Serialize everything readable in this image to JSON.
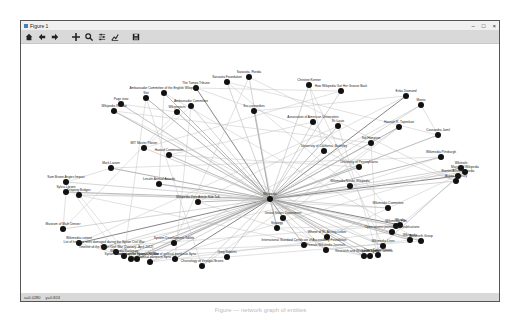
{
  "window": {
    "title": "Figure 1",
    "controls": {
      "minimize": "–",
      "maximize": "□",
      "close": "×"
    }
  },
  "toolbar": {
    "buttons": [
      {
        "name": "home-button",
        "icon": "home-icon",
        "tooltip": "Reset original view"
      },
      {
        "name": "back-button",
        "icon": "arrow-left-icon",
        "tooltip": "Back"
      },
      {
        "name": "forward-button",
        "icon": "arrow-right-icon",
        "tooltip": "Forward"
      },
      {
        "name": "pan-button",
        "icon": "move-icon",
        "tooltip": "Pan"
      },
      {
        "name": "zoom-button",
        "icon": "magnifier-icon",
        "tooltip": "Zoom to rectangle"
      },
      {
        "name": "subplots-button",
        "icon": "sliders-icon",
        "tooltip": "Configure subplots"
      },
      {
        "name": "axes-button",
        "icon": "chart-line-icon",
        "tooltip": "Edit axis"
      },
      {
        "name": "save-button",
        "icon": "floppy-disk-icon",
        "tooltip": "Save the figure"
      }
    ]
  },
  "status": {
    "x": "x=0.0280",
    "y": "y=0.824"
  },
  "caption": "Figure — network graph of entities",
  "graph": {
    "hub": {
      "x": 249,
      "y": 155,
      "label": "Wikipedia"
    },
    "nodes": [
      {
        "x": 175,
        "y": 44,
        "label": "The Tampa Tribune"
      },
      {
        "x": 206,
        "y": 38,
        "label": "Sarasota Foundation"
      },
      {
        "x": 228,
        "y": 33,
        "label": "Sarasota, Florida"
      },
      {
        "x": 143,
        "y": 49,
        "label": "Ambassador Committee of the English Wikipedia"
      },
      {
        "x": 125,
        "y": 54,
        "label": "Slot"
      },
      {
        "x": 100,
        "y": 60,
        "label": "Page view"
      },
      {
        "x": 93,
        "y": 67,
        "label": "Wikipedia Review"
      },
      {
        "x": 170,
        "y": 62,
        "label": "Ambassador Committee"
      },
      {
        "x": 156,
        "y": 68,
        "label": "Wikiprojects"
      },
      {
        "x": 233,
        "y": 67,
        "label": "Sru crossedtes"
      },
      {
        "x": 288,
        "y": 41,
        "label": "Christine Kenner"
      },
      {
        "x": 320,
        "y": 47,
        "label": "How Wikipedia Got Her Groove Back"
      },
      {
        "x": 385,
        "y": 52,
        "label": "Erika Diamond"
      },
      {
        "x": 400,
        "y": 61,
        "label": "Morris"
      },
      {
        "x": 292,
        "y": 78,
        "label": "Association of American Universities"
      },
      {
        "x": 317,
        "y": 82,
        "label": "St. Louis"
      },
      {
        "x": 378,
        "y": 83,
        "label": "Hannah R. Topeekan"
      },
      {
        "x": 350,
        "y": 99,
        "label": "Sid Hampton"
      },
      {
        "x": 417,
        "y": 91,
        "label": "Cassandra Jamil"
      },
      {
        "x": 303,
        "y": 107,
        "label": "University of California, Berkeley"
      },
      {
        "x": 338,
        "y": 123,
        "label": "University of Pennsylvania"
      },
      {
        "x": 420,
        "y": 113,
        "label": "Wikimedia Pittsburgh"
      },
      {
        "x": 440,
        "y": 124,
        "label": "Wikitrails"
      },
      {
        "x": 444,
        "y": 128,
        "label": "Maryland Wikipedia"
      },
      {
        "x": 437,
        "y": 132,
        "label": "Barnes/Allen/Wikipedia"
      },
      {
        "x": 435,
        "y": 137,
        "label": "Aspen Mosbury"
      },
      {
        "x": 123,
        "y": 104,
        "label": "MIT Master Plaster"
      },
      {
        "x": 148,
        "y": 111,
        "label": "Hazard Commission"
      },
      {
        "x": 90,
        "y": 124,
        "label": "Mark Larsen"
      },
      {
        "x": 45,
        "y": 138,
        "label": "Sam Brown Angies Impact"
      },
      {
        "x": 45,
        "y": 148,
        "label": "Sylvia Larsen"
      },
      {
        "x": 58,
        "y": 151,
        "label": "Drawing Bridges"
      },
      {
        "x": 138,
        "y": 140,
        "label": "Lincoln Annual Awards"
      },
      {
        "x": 177,
        "y": 158,
        "label": "Wikipedia Zero Article Sub Talk"
      },
      {
        "x": 329,
        "y": 142,
        "label": "Wikimedia Nordic Wikipedia"
      },
      {
        "x": 42,
        "y": 185,
        "label": "Museum of Math Denver"
      },
      {
        "x": 58,
        "y": 199,
        "label": "Wikimedia content"
      },
      {
        "x": 83,
        "y": 203,
        "label": "List of heritage sites damaged during the Syrian Civil War"
      },
      {
        "x": 95,
        "y": 208,
        "label": "Timeline of the Syrian Civil War (January–April 2012)"
      },
      {
        "x": 103,
        "y": 212,
        "label": "Wikipedia Rankings"
      },
      {
        "x": 116,
        "y": 215,
        "label": "Timeline of the Syrian Civil War"
      },
      {
        "x": 129,
        "y": 218,
        "label": "List of political parties in Syria"
      },
      {
        "x": 110,
        "y": 215,
        "label": "Syrian Observatory for Human Rights"
      },
      {
        "x": 153,
        "y": 199,
        "label": "System Development Tables"
      },
      {
        "x": 256,
        "y": 184,
        "label": "Strategy"
      },
      {
        "x": 262,
        "y": 174,
        "label": "United States Department"
      },
      {
        "x": 306,
        "y": 193,
        "label": "Whose of St. Antony Leiber"
      },
      {
        "x": 367,
        "y": 164,
        "label": "Wikimedia Committee"
      },
      {
        "x": 379,
        "y": 181,
        "label": "Whisky"
      },
      {
        "x": 375,
        "y": 182,
        "label": "Wikimedia Film"
      },
      {
        "x": 371,
        "y": 188,
        "label": "Open access journals and publications"
      },
      {
        "x": 389,
        "y": 196,
        "label": "Wikimedia"
      },
      {
        "x": 400,
        "y": 197,
        "label": "Ainsworth Group"
      },
      {
        "x": 362,
        "y": 202,
        "label": "Wikimedia Lines"
      },
      {
        "x": 357,
        "y": 211,
        "label": "Doris Kasper Grant"
      },
      {
        "x": 349,
        "y": 212,
        "label": "Sarah Lewis"
      },
      {
        "x": 343,
        "y": 212,
        "label": "Research and Wikipedia System Service"
      },
      {
        "x": 283,
        "y": 201,
        "label": "International Standard Certificate of Accessibility Foundation"
      },
      {
        "x": 305,
        "y": 206,
        "label": "Female Wikipedia Journals"
      },
      {
        "x": 206,
        "y": 213,
        "label": "Greg Roberts"
      },
      {
        "x": 154,
        "y": 215,
        "label": "List of political parties in Syria"
      },
      {
        "x": 181,
        "y": 222,
        "label": "Chronology of Vestigial Brains"
      }
    ]
  }
}
